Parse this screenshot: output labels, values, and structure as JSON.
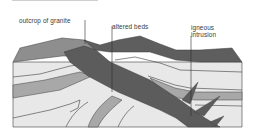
{
  "figure": {
    "type": "geological-cross-section",
    "labels": {
      "granite": "outcrop of granite",
      "altered": "altered beds",
      "igneous_line1": "igneous",
      "igneous_line2": "intrusion"
    },
    "colors": {
      "background": "#ffffff",
      "granite_dark": "#5c5c5c",
      "cap_layer": "#6a6a6a",
      "light_bed": "#e6e6e6",
      "mid_bed": "#a9a9a9",
      "outline": "#3c3c3c"
    }
  }
}
